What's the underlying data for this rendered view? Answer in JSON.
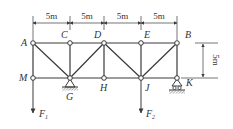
{
  "diagram": {
    "type": "truss",
    "colors": {
      "line": "#3a3a3a",
      "node_fill": "#ffffff",
      "text": "#333333"
    },
    "top_nodes": [
      {
        "id": "A",
        "x": 33,
        "y": 43
      },
      {
        "id": "C",
        "x": 70,
        "y": 43
      },
      {
        "id": "D",
        "x": 104,
        "y": 43
      },
      {
        "id": "E",
        "x": 141,
        "y": 43
      },
      {
        "id": "B",
        "x": 177,
        "y": 43
      }
    ],
    "bottom_nodes": [
      {
        "id": "M",
        "x": 33,
        "y": 78
      },
      {
        "id": "G",
        "x": 70,
        "y": 78
      },
      {
        "id": "H",
        "x": 104,
        "y": 78
      },
      {
        "id": "J",
        "x": 141,
        "y": 78
      },
      {
        "id": "K",
        "x": 177,
        "y": 78
      }
    ],
    "members": [
      [
        "A",
        "C"
      ],
      [
        "C",
        "D"
      ],
      [
        "D",
        "E"
      ],
      [
        "E",
        "B"
      ],
      [
        "M",
        "G"
      ],
      [
        "G",
        "H"
      ],
      [
        "H",
        "J"
      ],
      [
        "J",
        "K"
      ],
      [
        "A",
        "M"
      ],
      [
        "C",
        "G"
      ],
      [
        "D",
        "H"
      ],
      [
        "E",
        "J"
      ],
      [
        "B",
        "K"
      ],
      [
        "A",
        "G"
      ],
      [
        "D",
        "G"
      ],
      [
        "D",
        "J"
      ],
      [
        "B",
        "J"
      ]
    ],
    "supports": [
      {
        "node": "G",
        "type": "pin"
      },
      {
        "node": "K",
        "type": "roller"
      }
    ],
    "loads": [
      {
        "node": "M",
        "label": "F",
        "subscript": "1",
        "direction": "down"
      },
      {
        "node": "J",
        "label": "F",
        "subscript": "2",
        "direction": "down"
      }
    ],
    "labels": {
      "A": "A",
      "C": "C",
      "D": "D",
      "E": "E",
      "B": "B",
      "M": "M",
      "G": "G",
      "H": "H",
      "J": "J",
      "K": "K",
      "F1_main": "F",
      "F1_sub": "1",
      "F2_main": "F",
      "F2_sub": "2"
    },
    "dimensions": {
      "horizontal": [
        "5m",
        "5m",
        "5m",
        "5m"
      ],
      "vertical": "5m"
    }
  }
}
